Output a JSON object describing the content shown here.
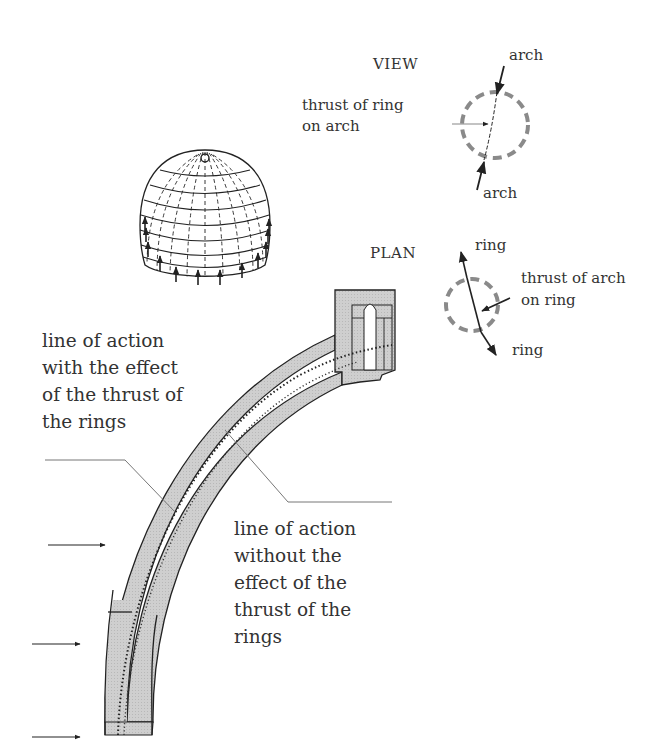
{
  "figure": {
    "type": "structural diagram of a dome: ring/arch thrust interaction and lines of action in a meridian section",
    "colors": {
      "ink": "#222222",
      "masonry_fill": "#cfcfcf",
      "dashed_circle": "#8a8a8a",
      "leader_line": "#777777"
    }
  },
  "view_panel": {
    "title": "VIEW",
    "top_arrow_label": "arch",
    "bottom_arrow_label": "arch",
    "ring_thrust_label": [
      "thrust of ring",
      "on arch"
    ]
  },
  "plan_panel": {
    "title": "PLAN",
    "top_arrow_label": "ring",
    "bottom_arrow_label": "ring",
    "arch_thrust_label": [
      "thrust of arch",
      "on ring"
    ]
  },
  "dome_sketch": {
    "meridians_dashed": true,
    "parallel_rings": 7,
    "base_arrows_count": 14,
    "arrow_direction": "up"
  },
  "section": {
    "label_with_rings": [
      "line of action",
      "with the effect",
      "of the thrust of",
      "the rings"
    ],
    "label_without_rings": [
      "line of action",
      "without the",
      "effect of the",
      "thrust of the",
      "rings"
    ],
    "side_arrows_count": 3
  }
}
